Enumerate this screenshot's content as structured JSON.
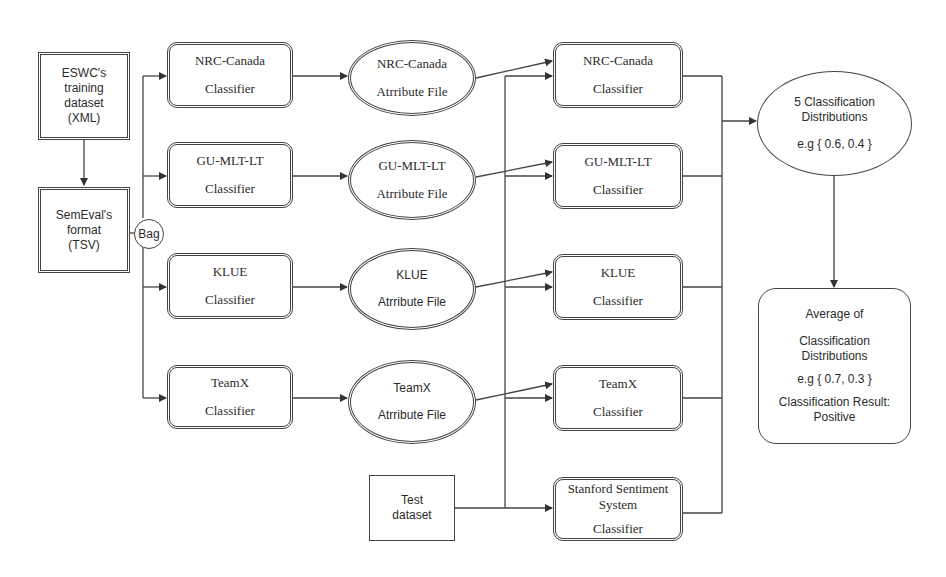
{
  "inputs": {
    "eswc": {
      "lines": [
        "ESWC's",
        "training",
        "dataset",
        "(XML)"
      ]
    },
    "semeval": {
      "lines": [
        "SemEval's",
        "format",
        "(TSV)"
      ]
    },
    "bag": {
      "label": "Bag"
    },
    "test": {
      "lines": [
        "Test",
        "dataset"
      ]
    }
  },
  "training_classifiers": [
    {
      "name": "NRC-Canada",
      "sub": "Classifier"
    },
    {
      "name": "GU-MLT-LT",
      "sub": "Classifier"
    },
    {
      "name": "KLUE",
      "sub": "Classifier"
    },
    {
      "name": "TeamX",
      "sub": "Classifier"
    }
  ],
  "attribute_files": [
    {
      "name": "NRC-Canada",
      "sub": "Atrribute File"
    },
    {
      "name": "GU-MLT-LT",
      "sub": "Atrribute File"
    },
    {
      "name": "KLUE",
      "sub": "Atrribute File"
    },
    {
      "name": "TeamX",
      "sub": "Atrribute File"
    }
  ],
  "test_classifiers": [
    {
      "name": "NRC-Canada",
      "sub": "Classifier"
    },
    {
      "name": "GU-MLT-LT",
      "sub": "Classifier"
    },
    {
      "name": "KLUE",
      "sub": "Classifier"
    },
    {
      "name": "TeamX",
      "sub": "Classifier"
    },
    {
      "name_lines": [
        "Stanford Sentiment",
        "System"
      ],
      "sub": "Classifier"
    }
  ],
  "distributions": {
    "lines": [
      "5 Classification",
      "Distributions"
    ],
    "example": "e.g { 0.6, 0.4 }"
  },
  "average": {
    "title": "Average of",
    "lines": [
      "Classification",
      "Distributions"
    ],
    "example": "e.g { 0.7, 0.3 }",
    "result_lines": [
      "Classification Result:",
      "Positive"
    ]
  },
  "colors": {
    "stroke": "#444444",
    "text": "#2b2b2b",
    "background": "#ffffff"
  }
}
